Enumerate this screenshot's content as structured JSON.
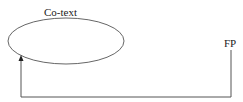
{
  "diagram": {
    "nodes": [
      {
        "id": "cotext",
        "label": "Co-text",
        "shape": "ellipse"
      },
      {
        "id": "fp",
        "label": "FP",
        "shape": "text"
      }
    ],
    "edges": [
      {
        "from": "fp",
        "to": "cotext",
        "style": "orthogonal-arrow"
      }
    ]
  }
}
